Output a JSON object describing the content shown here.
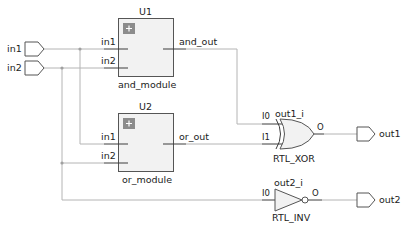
{
  "schematic": {
    "ports_in": [
      {
        "label": "in1"
      },
      {
        "label": "in2"
      }
    ],
    "ports_out": [
      {
        "label": "out1"
      },
      {
        "label": "out2"
      }
    ],
    "modules": [
      {
        "instance": "U1",
        "type": "and_module",
        "pins_in": [
          "in1",
          "in2"
        ],
        "pin_out": "and_out",
        "expand_icon": "plus-icon"
      },
      {
        "instance": "U2",
        "type": "or_module",
        "pins_in": [
          "in1",
          "in2"
        ],
        "pin_out": "or_out",
        "expand_icon": "plus-icon"
      }
    ],
    "gates": [
      {
        "instance": "out1_i",
        "type": "RTL_XOR",
        "pins_in": [
          "I0",
          "I1"
        ],
        "pin_out": "O"
      },
      {
        "instance": "out2_i",
        "type": "RTL_INV",
        "pins_in": [
          "I0"
        ],
        "pin_out": "O"
      }
    ]
  },
  "colors": {
    "wire": "#b4b4b4",
    "box_fill": "#f2f2f2",
    "box_stroke": "#555555",
    "expand_icon": "#8c8c8c"
  }
}
